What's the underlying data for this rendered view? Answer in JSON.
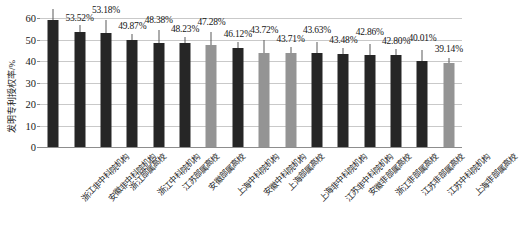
{
  "chart_data": {
    "type": "bar",
    "title": "",
    "xlabel": "",
    "ylabel": "发明专利授权率/%",
    "ylim": [
      0,
      60
    ],
    "yticks": [
      0,
      10,
      20,
      30,
      40,
      50,
      60
    ],
    "ytick_labels": [
      "0",
      "10",
      "20",
      "30",
      "40",
      "50",
      "60"
    ],
    "grid": true,
    "legend": "none",
    "categories": [
      "浙江非中科院机构",
      "安徽非中科院机构",
      "浙江部属高校",
      "浙江中科院机构",
      "江苏部属高校",
      "安徽部属高校",
      "上海中科院机构",
      "安徽中科院机构",
      "上海部属高校",
      "上海非中科院机构",
      "江苏非中科院机构",
      "安徽非部属高校",
      "浙江非部属高校",
      "江苏非部属高校",
      "江苏中科院机构",
      "上海非部属高校"
    ],
    "values": [
      58.95,
      53.52,
      53.18,
      49.87,
      48.38,
      48.23,
      47.28,
      46.12,
      43.72,
      43.71,
      43.63,
      43.48,
      42.86,
      42.8,
      40.01,
      39.14
    ],
    "data_labels": [
      "58.95%",
      "53.52%",
      "53.18%",
      "49.87%",
      "48.38%",
      "48.23%",
      "47.28%",
      "46.12%",
      "43.72%",
      "43.71%",
      "43.63%",
      "43.48%",
      "42.86%",
      "42.80%",
      "40.01%",
      "39.14%"
    ],
    "bar_colors": [
      "dark",
      "dark",
      "dark",
      "dark",
      "dark",
      "dark",
      "gray",
      "dark",
      "gray",
      "gray",
      "dark",
      "dark",
      "dark",
      "dark",
      "dark",
      "gray"
    ],
    "colors": {
      "dark": "#262626",
      "gray": "#949494",
      "gridline": "#c9c9c9",
      "axis": "#8d8d8d"
    }
  }
}
